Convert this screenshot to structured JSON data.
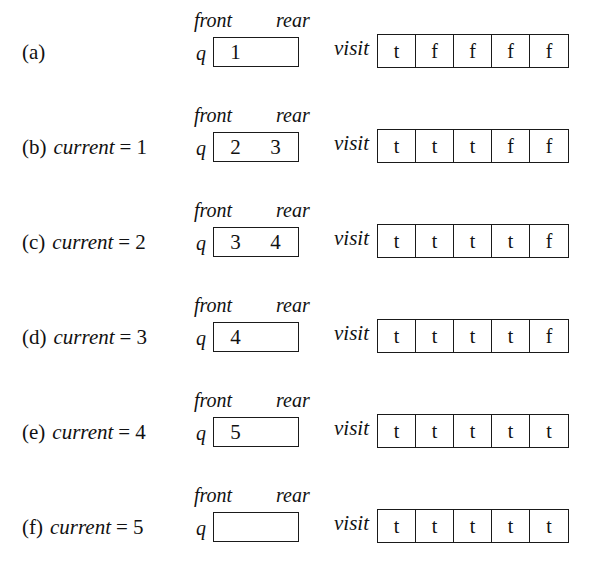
{
  "figure": {
    "labels": {
      "front": "front",
      "rear": "rear",
      "queue_name": "q",
      "visit_name": "visit",
      "current_name": "current",
      "equals": "="
    },
    "colors": {
      "ink": "#111111",
      "border": "#1a1a1a",
      "background": "#ffffff"
    },
    "rows": [
      {
        "tag": "(a)",
        "has_current": false,
        "current_value": "",
        "queue": [
          "1",
          ""
        ],
        "visit": [
          "t",
          "f",
          "f",
          "f",
          "f"
        ]
      },
      {
        "tag": "(b)",
        "has_current": true,
        "current_value": "1",
        "queue": [
          "2",
          "3"
        ],
        "visit": [
          "t",
          "t",
          "t",
          "f",
          "f"
        ]
      },
      {
        "tag": "(c)",
        "has_current": true,
        "current_value": "2",
        "queue": [
          "3",
          "4"
        ],
        "visit": [
          "t",
          "t",
          "t",
          "t",
          "f"
        ]
      },
      {
        "tag": "(d)",
        "has_current": true,
        "current_value": "3",
        "queue": [
          "4",
          ""
        ],
        "visit": [
          "t",
          "t",
          "t",
          "t",
          "f"
        ]
      },
      {
        "tag": "(e)",
        "has_current": true,
        "current_value": "4",
        "queue": [
          "5",
          ""
        ],
        "visit": [
          "t",
          "t",
          "t",
          "t",
          "t"
        ]
      },
      {
        "tag": "(f)",
        "has_current": true,
        "current_value": "5",
        "queue": [
          "",
          ""
        ],
        "visit": [
          "t",
          "t",
          "t",
          "t",
          "t"
        ]
      }
    ]
  }
}
